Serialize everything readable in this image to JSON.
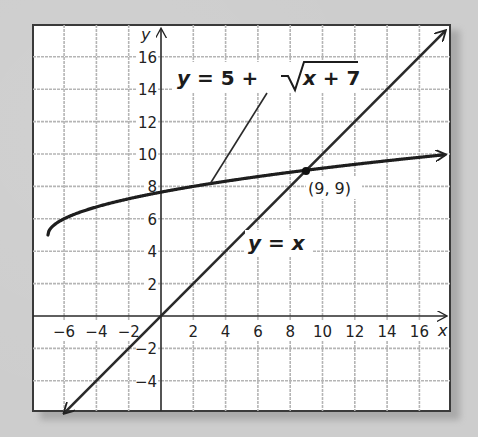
{
  "chart_data": {
    "type": "line",
    "title": "",
    "xlabel": "x",
    "ylabel": "y",
    "xlim": [
      -8,
      18
    ],
    "ylim": [
      -6,
      18
    ],
    "grid": true,
    "grid_step": 2,
    "x_ticks": [
      -6,
      -4,
      -2,
      2,
      4,
      6,
      8,
      10,
      12,
      14,
      16
    ],
    "y_ticks": [
      -4,
      -2,
      2,
      4,
      6,
      8,
      10,
      12,
      14,
      16
    ],
    "x_tick_labels": [
      "−6",
      "−4",
      "−2",
      "2",
      "4",
      "6",
      "8",
      "10",
      "12",
      "14",
      "16"
    ],
    "y_tick_labels": [
      "−4",
      "−2",
      "2",
      "4",
      "6",
      "8",
      "10",
      "12",
      "14",
      "16"
    ],
    "series": [
      {
        "name": "y = 5 + √(x + 7)",
        "label_parts": [
          "y",
          " = 5 + ",
          "√",
          "x + 7"
        ],
        "type": "curve",
        "domain": [
          -7,
          18
        ],
        "arrow_end": "right",
        "points": [
          {
            "x": -7,
            "y": 5
          },
          {
            "x": -6,
            "y": 6
          },
          {
            "x": -3,
            "y": 7.24
          },
          {
            "x": 0,
            "y": 7.65
          },
          {
            "x": 2,
            "y": 8
          },
          {
            "x": 9,
            "y": 9
          },
          {
            "x": 18,
            "y": 10
          }
        ]
      },
      {
        "name": "y = x",
        "label_parts": [
          "y",
          " = ",
          "x"
        ],
        "type": "line",
        "arrow_end": "both",
        "points": [
          {
            "x": -6,
            "y": -6
          },
          {
            "x": 0,
            "y": 0
          },
          {
            "x": 9,
            "y": 9
          },
          {
            "x": 18,
            "y": 18
          }
        ]
      }
    ],
    "annotations": [
      {
        "type": "point",
        "x": 9,
        "y": 9,
        "label": "(9, 9)"
      },
      {
        "type": "leader-line",
        "from": {
          "x": 3,
          "y": 8.1
        },
        "to_label": "y = 5 + √(x + 7)"
      }
    ],
    "legend": "none (inline labels)"
  },
  "labels": {
    "x_axis": "x",
    "y_axis": "y",
    "curve_eq_y": "y",
    "curve_eq_mid": " = 5 + ",
    "curve_eq_x": "x",
    "curve_eq_tail": " + 7",
    "line_eq_y": "y",
    "line_eq_mid": " = ",
    "line_eq_x": "x",
    "intersection": "(9, 9)"
  },
  "colors": {
    "curve": "#1e1e1e",
    "line": "#2a2a2a",
    "grid": "#b5b5b5",
    "frame": "#3a3a3a",
    "background": "#cdcdcd",
    "plot_bg": "#ffffff"
  }
}
